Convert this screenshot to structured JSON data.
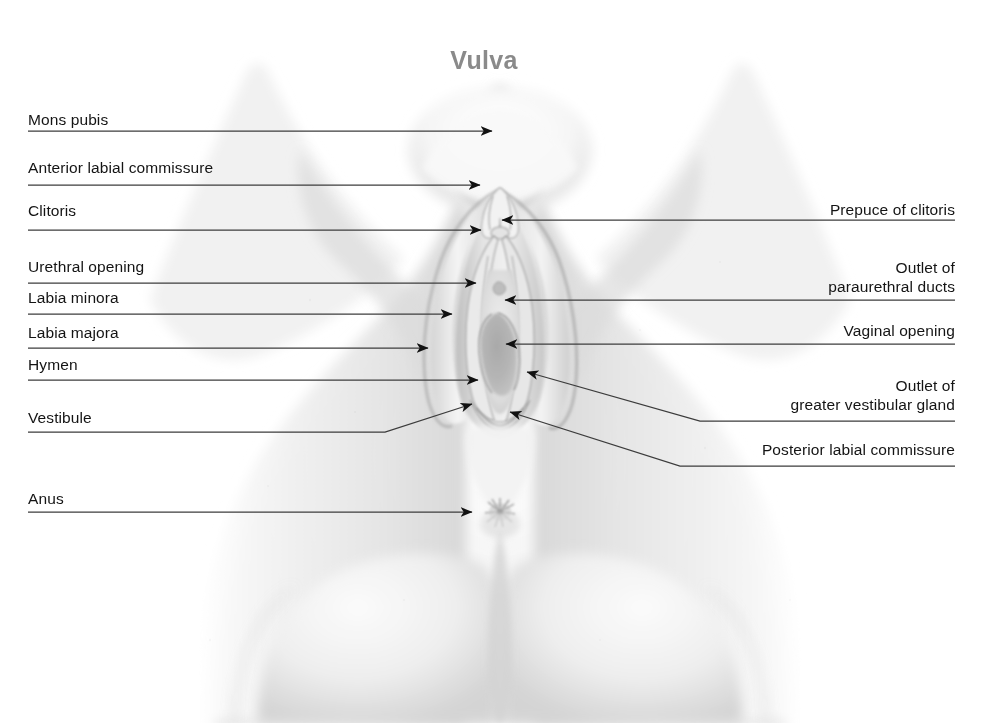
{
  "figure": {
    "title": "Vulva",
    "title_color": "#8a8a8a",
    "background_color": "#ffffff",
    "leader_color": "#3c3c3c",
    "text_color": "#141414",
    "width": 982,
    "height": 723
  },
  "labels_left": [
    {
      "id": "mons-pubis",
      "text": "Mons pubis",
      "x": 28,
      "y": 110,
      "line_y": 131,
      "line_x1": 28,
      "line_x2": 200,
      "arrow_x": 492,
      "arrow_y": 131
    },
    {
      "id": "anterior-labial-commissure",
      "text": "Anterior labial commissure",
      "x": 28,
      "y": 158,
      "line_y": 185,
      "line_x1": 28,
      "line_x2": 236,
      "arrow_x": 480,
      "arrow_y": 185
    },
    {
      "id": "clitoris",
      "text": "Clitoris",
      "x": 28,
      "y": 201,
      "line_y": 230,
      "line_x1": 28,
      "line_x2": 236,
      "arrow_x": 481,
      "arrow_y": 230
    },
    {
      "id": "urethral-opening",
      "text": "Urethral opening",
      "x": 28,
      "y": 257,
      "line_y": 283,
      "line_x1": 28,
      "line_x2": 236,
      "arrow_x": 476,
      "arrow_y": 283
    },
    {
      "id": "labia-minora",
      "text": "Labia minora",
      "x": 28,
      "y": 288,
      "line_y": 314,
      "line_x1": 28,
      "line_x2": 236,
      "arrow_x": 452,
      "arrow_y": 314
    },
    {
      "id": "labia-majora",
      "text": "Labia majora",
      "x": 28,
      "y": 323,
      "line_y": 348,
      "line_x1": 28,
      "line_x2": 236,
      "arrow_x": 428,
      "arrow_y": 348
    },
    {
      "id": "hymen",
      "text": "Hymen",
      "x": 28,
      "y": 355,
      "line_y": 380,
      "line_x1": 28,
      "line_x2": 236,
      "arrow_x": 478,
      "arrow_y": 380
    },
    {
      "id": "vestibule",
      "text": "Vestibule",
      "x": 28,
      "y": 408,
      "line_y": 432,
      "line_x1": 28,
      "line_x2": 236,
      "arrow_x": 472,
      "arrow_y": 404,
      "bend_x": 385
    },
    {
      "id": "anus",
      "text": "Anus",
      "x": 28,
      "y": 489,
      "line_y": 512,
      "line_x1": 28,
      "line_x2": 236,
      "arrow_x": 472,
      "arrow_y": 512
    }
  ],
  "labels_right": [
    {
      "id": "prepuce-of-clitoris",
      "lines": [
        "Prepuce of clitoris"
      ],
      "x_right": 955,
      "y": 200,
      "line_y": 220,
      "line_x1": 955,
      "line_x2": 800,
      "arrow_x": 502,
      "arrow_y": 220
    },
    {
      "id": "outlet-of-paraurethral-ducts",
      "lines": [
        "Outlet of",
        "paraurethral ducts"
      ],
      "x_right": 955,
      "y": 258,
      "line_y": 300,
      "line_x1": 955,
      "line_x2": 800,
      "arrow_x": 505,
      "arrow_y": 300
    },
    {
      "id": "vaginal-opening",
      "lines": [
        "Vaginal opening"
      ],
      "x_right": 955,
      "y": 321,
      "line_y": 344,
      "line_x1": 955,
      "line_x2": 800,
      "arrow_x": 506,
      "arrow_y": 344
    },
    {
      "id": "outlet-of-greater-vestibular-gland",
      "lines": [
        "Outlet of",
        "greater vestibular gland"
      ],
      "x_right": 955,
      "y": 376,
      "line_y": 421,
      "line_x1": 955,
      "line_x2": 730,
      "arrow_x": 527,
      "arrow_y": 372,
      "bend_x": 700
    },
    {
      "id": "posterior-labial-commissure",
      "lines": [
        "Posterior labial commissure"
      ],
      "x_right": 955,
      "y": 440,
      "line_y": 466,
      "line_x1": 955,
      "line_x2": 700,
      "arrow_x": 510,
      "arrow_y": 412,
      "bend_x": 680
    }
  ],
  "art": {
    "skin_light": "#fcfcfc",
    "skin_mid": "#e6e6e6",
    "skin_shadow": "#c9c9c9",
    "skin_deep": "#a8a8a8",
    "crease": "#9a9a9a",
    "vaginal_opening_fill": "#b4b4b4"
  }
}
